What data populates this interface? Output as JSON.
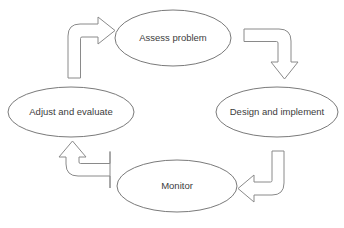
{
  "diagram": {
    "type": "cycle",
    "background_color": "#ffffff",
    "node_stroke_color": "#7a7a7a",
    "node_fill_color": "#ffffff",
    "arrow_stroke_color": "#8a8a8a",
    "arrow_fill_color": "#ffffff",
    "text_color": "#3c3c3c",
    "nodes": [
      {
        "id": "assess",
        "label": "Assess problem",
        "position": "top",
        "cx": 173,
        "cy": 38,
        "rx": 58,
        "ry": 28
      },
      {
        "id": "design",
        "label": "Design and implement",
        "position": "right",
        "cx": 277,
        "cy": 112,
        "rx": 61,
        "ry": 25
      },
      {
        "id": "monitor",
        "label": "Monitor",
        "position": "bottom",
        "cx": 177,
        "cy": 186,
        "rx": 60,
        "ry": 26
      },
      {
        "id": "adjust",
        "label": "Adjust and evaluate",
        "position": "left",
        "cx": 71,
        "cy": 112,
        "rx": 63,
        "ry": 25
      }
    ],
    "arrows": [
      {
        "id": "adjust-to-assess",
        "from": "adjust",
        "to": "assess",
        "direction": "up-then-right",
        "points_to": "right"
      },
      {
        "id": "assess-to-design",
        "from": "assess",
        "to": "design",
        "direction": "right-then-down",
        "points_to": "down"
      },
      {
        "id": "design-to-monitor",
        "from": "design",
        "to": "monitor",
        "direction": "down-then-left",
        "points_to": "left"
      },
      {
        "id": "monitor-to-adjust",
        "from": "monitor",
        "to": "adjust",
        "direction": "left-then-up",
        "points_to": "up"
      }
    ]
  }
}
